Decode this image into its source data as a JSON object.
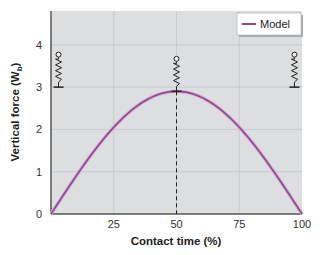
{
  "chart_data": {
    "type": "line",
    "title": "",
    "xlabel": "Contact time (%)",
    "ylabel_main": "Vertical force (W",
    "ylabel_sub": "b",
    "ylabel_close": ")",
    "xlim": [
      0,
      100
    ],
    "ylim": [
      0,
      4.8
    ],
    "x_ticks": [
      "0",
      "25",
      "50",
      "75",
      "100"
    ],
    "x_tick_values": [
      0,
      25,
      50,
      75,
      100
    ],
    "y_ticks": [
      "0",
      "1",
      "2",
      "3",
      "4"
    ],
    "y_tick_values": [
      0,
      1,
      2,
      3,
      4
    ],
    "grid": true,
    "legend_position": "upper right",
    "series": [
      {
        "name": "Model",
        "color": "#8b4a8c",
        "x": [
          0,
          10,
          20,
          25,
          30,
          40,
          50,
          60,
          70,
          75,
          80,
          90,
          100
        ],
        "values": [
          0,
          0.9,
          1.7,
          2.05,
          2.35,
          2.76,
          2.9,
          2.76,
          2.35,
          2.05,
          1.7,
          0.9,
          0
        ]
      }
    ],
    "annotations": [
      {
        "type": "dashed-vertical-line",
        "x": 50,
        "from_y": 0,
        "to_y": 2.9
      },
      {
        "type": "spring-icon",
        "x": 3,
        "base_y": 3.0,
        "label": "compressed-start"
      },
      {
        "type": "spring-icon",
        "x": 50,
        "base_y": 2.9,
        "label": "max-compression"
      },
      {
        "type": "spring-icon",
        "x": 97,
        "base_y": 3.0,
        "label": "compressed-end"
      }
    ]
  },
  "colors": {
    "plot_background": "#dcdee0",
    "grid": "#c3c6c9",
    "axis": "#555555",
    "curve": "#8b4a8c",
    "curve_glow": "#d6a8d4"
  },
  "legend": {
    "label": "Model"
  }
}
